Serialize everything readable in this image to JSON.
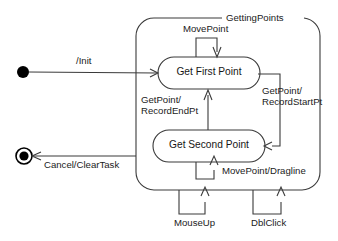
{
  "diagram": {
    "type": "uml-state-machine",
    "title": "GettingPoints",
    "composite_state": {
      "name": "GettingPoints",
      "label": "GettingPoints"
    },
    "pseudostates": {
      "initial": "initial-state-node",
      "final": "final-state-node"
    },
    "states": [
      {
        "id": "get-first-point",
        "label": "Get First Point"
      },
      {
        "id": "get-second-point",
        "label": "Get Second Point"
      }
    ],
    "transitions": [
      {
        "id": "init",
        "label": "/Init",
        "from": "initial",
        "to": "get-first-point"
      },
      {
        "id": "move-point-first",
        "label": "MovePoint",
        "from": "get-first-point",
        "to": "get-first-point"
      },
      {
        "id": "get-point-record-start",
        "label_line1": "GetPoint/",
        "label_line2": "RecordStartPt",
        "from": "get-first-point",
        "to": "get-second-point"
      },
      {
        "id": "get-point-record-end",
        "label_line1": "GetPoint/",
        "label_line2": "RecordEndPt",
        "from": "get-second-point",
        "to": "get-first-point"
      },
      {
        "id": "move-point-dragline",
        "label": "MovePoint/Dragline",
        "from": "get-second-point",
        "to": "get-second-point"
      },
      {
        "id": "cancel-clear-task",
        "label": "Cancel/ClearTask",
        "from": "GettingPoints",
        "to": "final"
      },
      {
        "id": "mouse-up",
        "label": "MouseUp",
        "from": "GettingPoints",
        "to": "GettingPoints"
      },
      {
        "id": "dbl-click",
        "label": "DblClick",
        "from": "GettingPoints",
        "to": "GettingPoints"
      }
    ],
    "colors": {
      "stroke": "#3a3a3a",
      "node": "#000000",
      "background": "#ffffff",
      "text": "#1b1b1b"
    },
    "footer": ""
  }
}
